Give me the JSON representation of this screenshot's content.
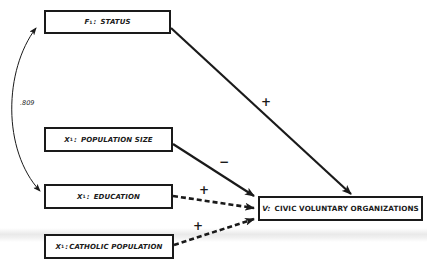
{
  "diagram": {
    "nodes": {
      "status": {
        "var": "F",
        "sub": "1",
        "sep": ":",
        "label": "STATUS"
      },
      "population_size": {
        "var": "X",
        "sub": "1",
        "sep": ":",
        "label": "POPULATION SIZE"
      },
      "education": {
        "var": "X",
        "sub": "1",
        "sep": ":",
        "label": "EDUCATION"
      },
      "catholic_population": {
        "var": "X",
        "sub": "1",
        "sep": ":",
        "label": "CATHOLIC POPULATION"
      },
      "civic_voluntary_organizations": {
        "var": "V:",
        "label": "CIVIC VOLUNTARY ORGANIZATIONS"
      }
    },
    "edges": [
      {
        "from": "status",
        "to": "civic_voluntary_organizations",
        "sign": "+",
        "style": "solid"
      },
      {
        "from": "population_size",
        "to": "civic_voluntary_organizations",
        "sign": "−",
        "style": "solid"
      },
      {
        "from": "education",
        "to": "civic_voluntary_organizations",
        "sign": "+",
        "style": "dashed"
      },
      {
        "from": "catholic_population",
        "to": "civic_voluntary_organizations",
        "sign": "+",
        "style": "dashed"
      }
    ],
    "correlation": {
      "between": [
        "status",
        "education"
      ],
      "value": ".809",
      "style": "curved double-headed"
    },
    "colors": {
      "ink": "#1a1a1a",
      "background": "#ffffff"
    }
  }
}
